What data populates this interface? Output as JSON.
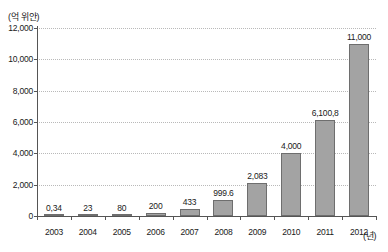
{
  "chart_data": {
    "type": "bar",
    "title": "",
    "subtitle": "",
    "xlabel": "(년)",
    "ylabel": "(억 위안)",
    "categories": [
      "2003",
      "2004",
      "2005",
      "2006",
      "2007",
      "2008",
      "2009",
      "2010",
      "2011",
      "2012"
    ],
    "values": [
      0.34,
      23,
      80,
      200,
      433,
      999.6,
      2083,
      4000,
      6100.8,
      11000
    ],
    "value_labels": [
      "0,34",
      "23",
      "80",
      "200",
      "433",
      "999.6",
      "2,083",
      "4,000",
      "6,100,8",
      "11,000"
    ],
    "ylim": [
      0,
      12000
    ],
    "yticks": [
      0,
      2000,
      4000,
      6000,
      8000,
      10000,
      12000
    ],
    "ytick_labels": [
      "0",
      "2,000",
      "4,000",
      "6,000",
      "8,000",
      "10,000",
      "12,000"
    ],
    "grid": true,
    "grid_axis": "y",
    "legend": false,
    "series": [
      {
        "name": "",
        "values": [
          0.34,
          23,
          80,
          200,
          433,
          999.6,
          2083,
          4000,
          6100.8,
          11000
        ]
      }
    ]
  },
  "colors": {
    "bar_fill": "#a3a3a3",
    "bar_stroke": "#6e6e6e",
    "axis": "#555555",
    "gridline": "#b9b9b9",
    "text": "#1a1a1a",
    "background": "#ffffff"
  }
}
